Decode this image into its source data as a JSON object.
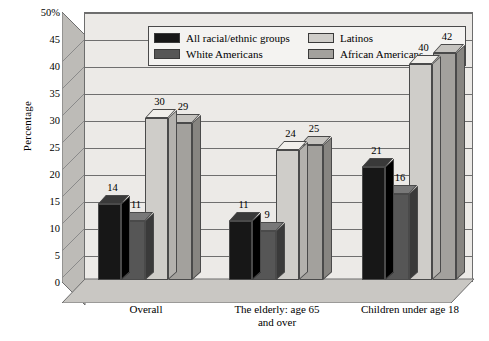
{
  "chart_data": {
    "type": "bar",
    "title": "",
    "subtitle": "",
    "xlabel": "",
    "ylabel": "Percentage",
    "ylim": [
      0,
      50
    ],
    "ytick_step": 5,
    "ytick_labels": [
      "50%",
      "45",
      "40",
      "35",
      "30",
      "25",
      "20",
      "15",
      "10",
      "5",
      "0"
    ],
    "ytick_values": [
      50,
      45,
      40,
      35,
      30,
      25,
      20,
      15,
      10,
      5,
      0
    ],
    "grid": true,
    "three_d": true,
    "legend_position": "top-inside",
    "categories": [
      "Overall",
      "The elderly: age 65 and over",
      "Children under age 18"
    ],
    "category_label_lines": [
      [
        "Overall"
      ],
      [
        "The elderly: age 65",
        "and over"
      ],
      [
        "Children under age 18"
      ]
    ],
    "series": [
      {
        "name": "All racial/ethnic groups",
        "color": "#171717",
        "values": [
          14,
          11,
          21
        ]
      },
      {
        "name": "White Americans",
        "color": "#565656",
        "values": [
          11,
          9,
          16
        ]
      },
      {
        "name": "Latinos",
        "color": "#cfcdc9",
        "values": [
          30,
          24,
          40
        ]
      },
      {
        "name": "African Americans",
        "color": "#a3a19d",
        "values": [
          29,
          25,
          42
        ]
      }
    ],
    "data_labels": [
      [
        "14",
        "11",
        "30",
        "29"
      ],
      [
        "11",
        "9",
        "24",
        "25"
      ],
      [
        "21",
        "16",
        "40",
        "42"
      ]
    ],
    "colors": {
      "plot_background": "#eceae7",
      "wall_shade": "#bdbbb7",
      "floor_shade": "#c9c7c3",
      "gridline": "#6f6f6f",
      "outline": "#4a4a4a",
      "legend_background": "#f4f3f1",
      "text": "#000000"
    }
  },
  "legend": {
    "items": [
      {
        "label": "All racial/ethnic groups",
        "swatch": "#171717"
      },
      {
        "label": "White Americans",
        "swatch": "#565656"
      },
      {
        "label": "Latinos",
        "swatch": "#cfcdc9"
      },
      {
        "label": "African Americans",
        "swatch": "#a3a19d"
      }
    ]
  }
}
